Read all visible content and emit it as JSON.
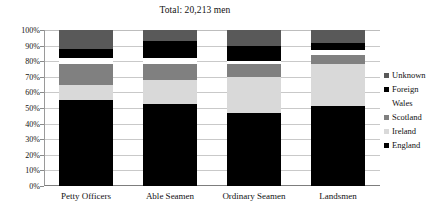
{
  "chart_data": {
    "type": "bar",
    "subtype": "stacked-100-percent",
    "title": "Total: 20,213 men",
    "xlabel": "",
    "ylabel": "",
    "ylim": [
      0,
      100
    ],
    "ytick_labels": [
      "100%",
      "90%",
      "80%",
      "70%",
      "60%",
      "50%",
      "40%",
      "30%",
      "20%",
      "10%",
      "0%"
    ],
    "ytick_values": [
      100,
      90,
      80,
      70,
      60,
      50,
      40,
      30,
      20,
      10,
      0
    ],
    "grid": true,
    "legend_position": "right",
    "categories": [
      "Petty Officers",
      "Able Seamen",
      "Ordinary Seamen",
      "Landsmen"
    ],
    "series": [
      {
        "name": "England",
        "color": "#000000",
        "values": [
          55.0,
          52.5,
          47.0,
          51.5
        ]
      },
      {
        "name": "Ireland",
        "color": "#d9d9d9",
        "values": [
          10.0,
          15.5,
          23.0,
          26.5
        ]
      },
      {
        "name": "Scotland",
        "color": "#808080",
        "values": [
          13.0,
          10.0,
          8.0,
          6.0
        ]
      },
      {
        "name": "Wales",
        "color": "#ffffff",
        "values": [
          4.0,
          4.0,
          2.0,
          3.0
        ]
      },
      {
        "name": "Foreign",
        "color": "#000000",
        "values": [
          6.0,
          11.0,
          10.0,
          5.0
        ]
      },
      {
        "name": "Unknown",
        "color": "#595959",
        "values": [
          12.0,
          7.0,
          10.0,
          8.0
        ]
      }
    ],
    "legend_entries": [
      {
        "label": "Unknown",
        "color": "#595959"
      },
      {
        "label": "Foreign",
        "color": "#000000"
      },
      {
        "label": "Wales",
        "color": "#ffffff"
      },
      {
        "label": "Scotland",
        "color": "#808080"
      },
      {
        "label": "Ireland",
        "color": "#d9d9d9"
      },
      {
        "label": "England",
        "color": "#000000"
      }
    ]
  }
}
